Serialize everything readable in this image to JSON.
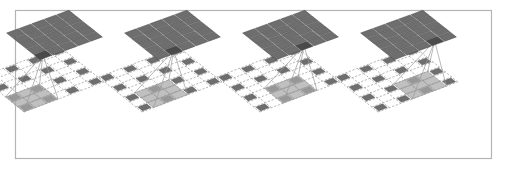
{
  "figure": {
    "domain": "diagram",
    "panel_count": 4,
    "frame": {
      "border_color": "#b4b4b4",
      "background": "#ffffff",
      "x": 15,
      "y": 10,
      "width": 476,
      "height": 148
    },
    "colors": {
      "output_grid_fill": "#6e6e6e",
      "output_grid_highlight": "#4a4a4a",
      "output_grid_line": "#4a4a4a",
      "input_cell_fill": "#6e6e6e",
      "input_grid_dashed": "#9a9a9a",
      "receptive_overlay": "#a8a8a8",
      "connector_line": "#9a9a9a"
    },
    "geometry": {
      "output_rows": 5,
      "output_cols": 5,
      "input_rows": 7,
      "input_cols": 7,
      "dilation_rate": 2,
      "kernel_size": 3,
      "projection": "isometric-parallelogram"
    },
    "panels": [
      {
        "index": 1,
        "label": "panel-1",
        "panel_x": 22,
        "output_highlight_cell": [
          0,
          0
        ],
        "receptive_origin": [
          0,
          0
        ],
        "sampled_cells": [
          [
            0,
            0
          ],
          [
            0,
            2
          ],
          [
            0,
            4
          ],
          [
            0,
            6
          ],
          [
            2,
            0
          ],
          [
            2,
            2
          ],
          [
            2,
            4
          ],
          [
            2,
            6
          ],
          [
            4,
            0
          ],
          [
            4,
            2
          ],
          [
            4,
            4
          ],
          [
            4,
            6
          ],
          [
            6,
            0
          ],
          [
            6,
            2
          ],
          [
            6,
            4
          ],
          [
            6,
            6
          ]
        ]
      },
      {
        "index": 2,
        "label": "panel-2",
        "panel_x": 140,
        "output_highlight_cell": [
          0,
          1
        ],
        "receptive_origin": [
          0,
          1
        ],
        "sampled_cells": [
          [
            0,
            0
          ],
          [
            0,
            2
          ],
          [
            0,
            4
          ],
          [
            0,
            6
          ],
          [
            2,
            0
          ],
          [
            2,
            2
          ],
          [
            2,
            4
          ],
          [
            2,
            6
          ],
          [
            4,
            0
          ],
          [
            4,
            2
          ],
          [
            4,
            4
          ],
          [
            4,
            6
          ],
          [
            6,
            0
          ],
          [
            6,
            2
          ],
          [
            6,
            4
          ],
          [
            6,
            6
          ]
        ]
      },
      {
        "index": 3,
        "label": "panel-3",
        "panel_x": 258,
        "output_highlight_cell": [
          0,
          2
        ],
        "receptive_origin": [
          0,
          2
        ],
        "sampled_cells": [
          [
            0,
            0
          ],
          [
            0,
            2
          ],
          [
            0,
            4
          ],
          [
            0,
            6
          ],
          [
            2,
            0
          ],
          [
            2,
            2
          ],
          [
            2,
            4
          ],
          [
            2,
            6
          ],
          [
            4,
            0
          ],
          [
            4,
            2
          ],
          [
            4,
            4
          ],
          [
            4,
            6
          ],
          [
            6,
            0
          ],
          [
            6,
            2
          ],
          [
            6,
            4
          ],
          [
            6,
            6
          ]
        ]
      },
      {
        "index": 4,
        "label": "panel-4",
        "panel_x": 376,
        "output_highlight_cell": [
          0,
          3
        ],
        "receptive_origin": [
          0,
          3
        ],
        "sampled_cells": [
          [
            0,
            0
          ],
          [
            0,
            2
          ],
          [
            0,
            4
          ],
          [
            0,
            6
          ],
          [
            2,
            0
          ],
          [
            2,
            2
          ],
          [
            2,
            4
          ],
          [
            2,
            6
          ],
          [
            4,
            0
          ],
          [
            4,
            2
          ],
          [
            4,
            4
          ],
          [
            4,
            6
          ],
          [
            6,
            0
          ],
          [
            6,
            2
          ],
          [
            6,
            4
          ],
          [
            6,
            6
          ]
        ]
      }
    ]
  }
}
